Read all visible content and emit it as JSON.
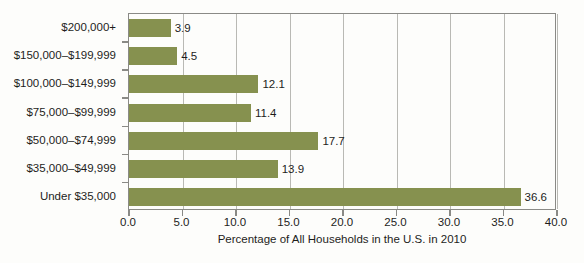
{
  "chart_data": {
    "type": "bar",
    "orientation": "horizontal",
    "title": "",
    "xlabel": "Percentage of All Households in the U.S. in 2010",
    "ylabel": "",
    "categories": [
      "$200,000+",
      "$150,000–$199,999",
      "$100,000–$149,999",
      "$75,000–$99,999",
      "$50,000–$74,999",
      "$35,000–$49,999",
      "Under $35,000"
    ],
    "values": [
      3.9,
      4.5,
      12.1,
      11.4,
      17.7,
      13.9,
      36.6
    ],
    "data_labels": [
      "3.9",
      "4.5",
      "12.1",
      "11.4",
      "17.7",
      "13.9",
      "36.6"
    ],
    "xlim": [
      0.0,
      40.0
    ],
    "xticks": [
      0.0,
      5.0,
      10.0,
      15.0,
      20.0,
      25.0,
      30.0,
      35.0,
      40.0
    ],
    "xtick_labels": [
      "0.0",
      "5.0",
      "10.0",
      "15.0",
      "20.0",
      "25.0",
      "30.0",
      "35.0",
      "40.0"
    ],
    "grid": "vertical",
    "legend": null,
    "bar_color": "#86914f",
    "grid_color": "#b9b9b4",
    "axis_color": "#8a8a86",
    "background": "#fdfdfb"
  }
}
